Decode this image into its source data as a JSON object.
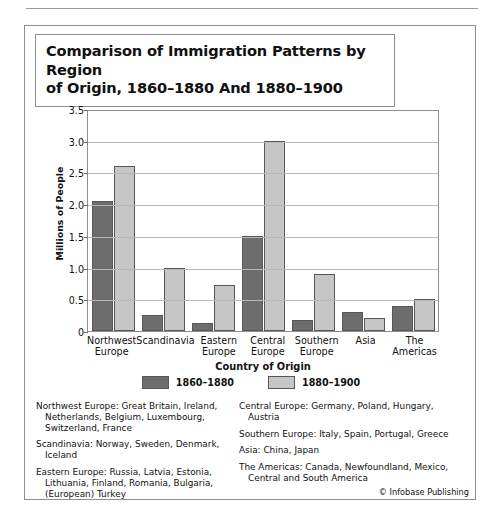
{
  "figure": {
    "title_lines": [
      "Comparison of Immigration Patterns by Region",
      "of Origin, 1860–1880 And 1880–1900"
    ],
    "credit": "© Infobase Publishing"
  },
  "chart_data": {
    "type": "bar",
    "title": "Comparison of Immigration Patterns by Region of Origin, 1860–1880 And 1880–1900",
    "xlabel": "Country of Origin",
    "ylabel": "Millions of People",
    "ylim": [
      0,
      3.5
    ],
    "yticks": [
      "0",
      "0.5",
      "1.0",
      "1.5",
      "2.0",
      "2.5",
      "3.0",
      "3.5"
    ],
    "ytick_values": [
      0,
      0.5,
      1.0,
      1.5,
      2.0,
      2.5,
      3.0,
      3.5
    ],
    "grid": true,
    "legend_position": "bottom",
    "categories": [
      "Northwest Europe",
      "Scandinavia",
      "Eastern Europe",
      "Central Europe",
      "Southern Europe",
      "Asia",
      "The Americas"
    ],
    "series": [
      {
        "name": "1860–1880",
        "color": "#6d6d6d",
        "values": [
          2.05,
          0.25,
          0.13,
          1.5,
          0.17,
          0.3,
          0.4
        ]
      },
      {
        "name": "1880–1900",
        "color": "#c6c6c6",
        "values": [
          2.6,
          1.0,
          0.72,
          3.0,
          0.9,
          0.2,
          0.5
        ]
      }
    ]
  },
  "notes": {
    "left": [
      "Northwest Europe: Great Britain, Ireland, Netherlands, Belgium, Luxembourg, Switzerland, France",
      "Scandinavia: Norway, Sweden, Denmark, Iceland",
      "Eastern Europe: Russia, Latvia, Estonia, Lithuania, Finland, Romania, Bulgaria, (European) Turkey"
    ],
    "right": [
      "Central Europe: Germany, Poland, Hungary, Austria",
      "Southern Europe: Italy, Spain, Portugal, Greece",
      "Asia: China, Japan",
      "The Americas: Canada, Newfoundland, Mexico, Central and South America"
    ]
  }
}
